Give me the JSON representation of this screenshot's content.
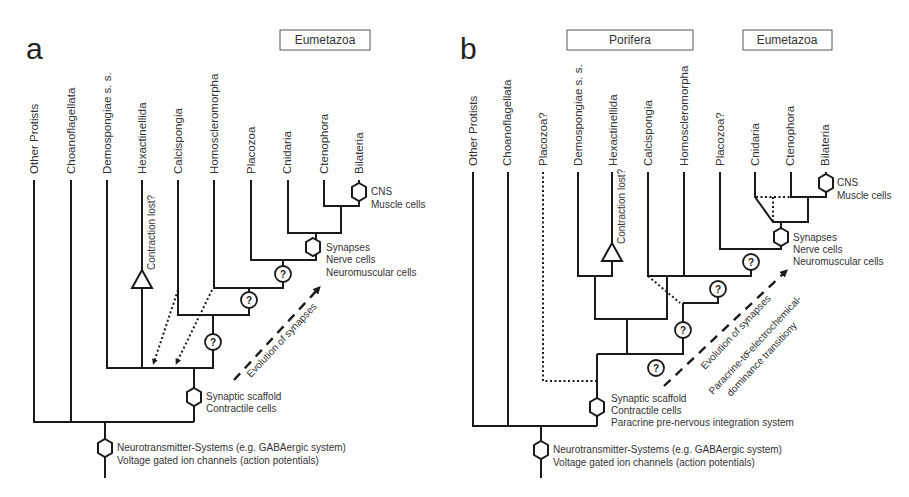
{
  "panels": {
    "a": {
      "label": "a",
      "clade_boxes": [
        "Eumetazoa"
      ],
      "taxa": [
        "Other Protists",
        "Choanoflagellata",
        "Demospongiae s. s.",
        "Hexactinellida",
        "Calcispongia",
        "Homoscleromorpha",
        "Placozoa",
        "Cnidaria",
        "Ctenophora",
        "Bilateria"
      ],
      "annotations": {
        "cns": "CNS",
        "muscle": "Muscle cells",
        "synapses": "Synapses",
        "nerve": "Nerve cells",
        "neuromuscular": "Neuromuscular cells",
        "contraction_lost": "Contraction lost?",
        "synaptic_scaffold": "Synaptic scaffold",
        "contractile": "Contractile cells",
        "neurotransmitter": "Neurotransmitter-Systems (e.g. GABAergic system)",
        "voltage": "Voltage gated ion channels (action potentials)",
        "evolution": "Evolution of synapses"
      },
      "question_marks": [
        "?",
        "?",
        "?"
      ]
    },
    "b": {
      "label": "b",
      "clade_boxes": [
        "Porifera",
        "Eumetazoa"
      ],
      "taxa": [
        "Other Protists",
        "Choanoflagellata",
        "Placozoa?",
        "Demospongiae s. s.",
        "Hexactinellida",
        "Calcispongia",
        "Homoscleromorpha",
        "Placozoa?",
        "Cnidaria",
        "Ctenophora",
        "Bilateria"
      ],
      "annotations": {
        "cns": "CNS",
        "muscle": "Muscle cells",
        "synapses": "Synapses",
        "nerve": "Nerve cells",
        "neuromuscular": "Neuromuscular cells",
        "contraction_lost": "Contraction lost?",
        "synaptic_scaffold": "Synaptic scaffold",
        "contractile": "Contractile cells",
        "paracrine": "Paracrine pre-nervous integration system",
        "neurotransmitter": "Neurotransmitter-Systems (e.g. GABAergic system)",
        "voltage": "Voltage gated ion channels (action potentials)",
        "evolution": "Evolution of synapses",
        "equals": "=",
        "transition_1": "Paracrine-to-electrochemical-",
        "transition_2": "dominance transitiony"
      },
      "question_marks": [
        "?",
        "?",
        "?",
        "?"
      ]
    }
  }
}
